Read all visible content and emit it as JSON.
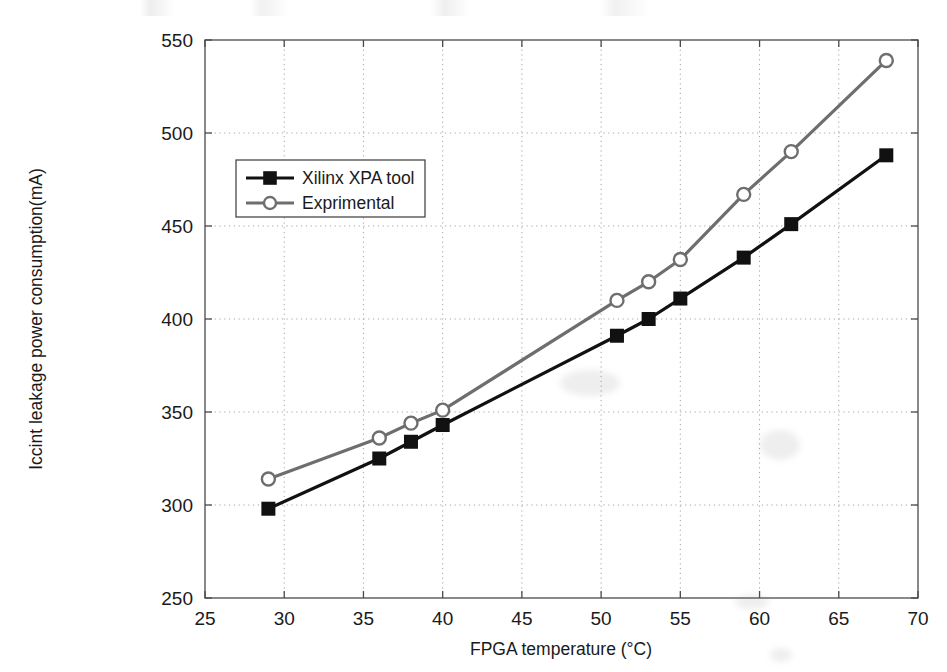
{
  "chart_data": {
    "type": "line",
    "title": "",
    "xlabel": "FPGA temperature (°C)",
    "ylabel": "Iccint leakage power consumption(mA)",
    "xlim": [
      25,
      70
    ],
    "ylim": [
      250,
      550
    ],
    "xticks": [
      25,
      30,
      35,
      40,
      45,
      50,
      55,
      60,
      65,
      70
    ],
    "yticks": [
      250,
      300,
      350,
      400,
      450,
      500,
      550
    ],
    "xtick_labels": [
      "25",
      "30",
      "35",
      "40",
      "45",
      "50",
      "55",
      "60",
      "65",
      "70"
    ],
    "ytick_labels": [
      "250",
      "300",
      "350",
      "400",
      "450",
      "500",
      "550"
    ],
    "grid": true,
    "grid_style": "dotted",
    "legend_position": "upper-left-inset",
    "series": [
      {
        "name": "Xilinx XPA tool",
        "color": "#111111",
        "marker": "square",
        "marker_filled": true,
        "x": [
          29,
          36,
          38,
          40,
          51,
          53,
          55,
          59,
          62,
          68
        ],
        "values": [
          298,
          325,
          334,
          343,
          391,
          400,
          411,
          433,
          451,
          488
        ]
      },
      {
        "name": "Exprimental",
        "color": "#6e6e6e",
        "marker": "circle",
        "marker_filled": false,
        "x": [
          29,
          36,
          38,
          40,
          51,
          53,
          55,
          59,
          62,
          68
        ],
        "values": [
          314,
          336,
          344,
          351,
          410,
          420,
          432,
          467,
          490,
          539
        ]
      }
    ]
  },
  "legend": {
    "entries": [
      {
        "label": "Xilinx XPA tool"
      },
      {
        "label": "Exprimental"
      }
    ]
  },
  "axes": {
    "x_title": "FPGA temperature (°C)",
    "y_title": "Iccint leakage power consumption(mA)"
  },
  "colors": {
    "series_1": "#111111",
    "series_2": "#6e6e6e",
    "axis": "#4a4a4a",
    "grid": "#9a9a9a",
    "background": "#ffffff"
  }
}
